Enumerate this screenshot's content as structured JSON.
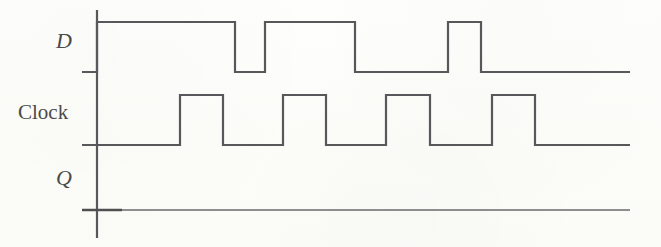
{
  "figure": {
    "kind": "digital-timing-diagram",
    "background_color": "#fdfdfa",
    "line_color": "#58585a",
    "line_width": 2.2,
    "width": 661,
    "height": 247
  },
  "axis": {
    "name": "time-origin-axis",
    "x": 97,
    "y_top": 10,
    "y_bottom": 238
  },
  "signals": [
    {
      "id": "d",
      "label": "D",
      "label_style": "italic",
      "label_x": 56,
      "label_y": 30,
      "baseline_y": 72,
      "high_y": 22,
      "x_start": 82,
      "x_end": 630
    },
    {
      "id": "clock",
      "label": "Clock",
      "label_style": "roman",
      "label_x": 18,
      "label_y": 102,
      "baseline_y": 145,
      "high_y": 95,
      "x_start": 82,
      "x_end": 630
    },
    {
      "id": "q",
      "label": "Q",
      "label_style": "italic",
      "label_x": 56,
      "label_y": 167,
      "baseline_y": 210,
      "high_y": 160,
      "x_start": 82,
      "x_end": 630
    }
  ],
  "chart_data": {
    "type": "line",
    "title": "",
    "xlabel": "",
    "ylabel": "",
    "x_axis": {
      "units": "pixels",
      "origin_x": 97,
      "range": [
        82,
        630
      ],
      "ticks": [],
      "grid": false
    },
    "legend": {
      "position": "left-axis-labels",
      "entries": [
        "D",
        "Clock",
        "Q"
      ]
    },
    "series": [
      {
        "name": "D",
        "levels": [
          "high",
          "low",
          "high",
          "low",
          "high",
          "low"
        ],
        "transitions_x": [
          97,
          235,
          265,
          355,
          448,
          481,
          630
        ],
        "baseline_y": 72,
        "high_y": 22,
        "points": [
          [
            82,
            72
          ],
          [
            97,
            72
          ],
          [
            97,
            22
          ],
          [
            235,
            22
          ],
          [
            235,
            72
          ],
          [
            265,
            72
          ],
          [
            265,
            22
          ],
          [
            355,
            22
          ],
          [
            355,
            72
          ],
          [
            448,
            72
          ],
          [
            448,
            22
          ],
          [
            481,
            22
          ],
          [
            481,
            72
          ],
          [
            630,
            72
          ]
        ]
      },
      {
        "name": "Clock",
        "levels": [
          "low",
          "high",
          "low",
          "high",
          "low",
          "high",
          "low",
          "high",
          "low"
        ],
        "pulses": [
          {
            "rise_x": 180,
            "fall_x": 223
          },
          {
            "rise_x": 283,
            "fall_x": 326
          },
          {
            "rise_x": 386,
            "fall_x": 430
          },
          {
            "rise_x": 492,
            "fall_x": 535
          }
        ],
        "baseline_y": 145,
        "high_y": 95,
        "points": [
          [
            82,
            145
          ],
          [
            180,
            145
          ],
          [
            180,
            95
          ],
          [
            223,
            95
          ],
          [
            223,
            145
          ],
          [
            283,
            145
          ],
          [
            283,
            95
          ],
          [
            326,
            95
          ],
          [
            326,
            145
          ],
          [
            386,
            145
          ],
          [
            386,
            95
          ],
          [
            430,
            95
          ],
          [
            430,
            145
          ],
          [
            492,
            145
          ],
          [
            492,
            95
          ],
          [
            535,
            95
          ],
          [
            535,
            145
          ],
          [
            630,
            145
          ]
        ]
      },
      {
        "name": "Q",
        "levels": [
          "low"
        ],
        "transitions_x": [],
        "baseline_y": 210,
        "high_y": 160,
        "points": [
          [
            82,
            210
          ],
          [
            630,
            210
          ]
        ]
      }
    ]
  }
}
